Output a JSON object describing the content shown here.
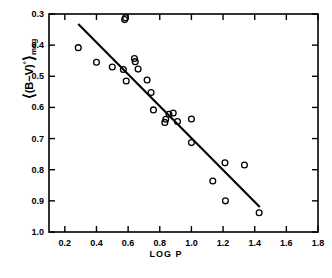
{
  "chart_data": {
    "type": "scatter",
    "title": "",
    "xlabel": "LOG P",
    "ylabel": "⟨(B−V)°⟩mag",
    "ylabel_parts": {
      "open_bracket": "⟨",
      "expression": "(B−V)",
      "superscript": "°",
      "close_bracket": "⟩",
      "subscript": "mag"
    },
    "xlim": [
      0.1,
      1.8
    ],
    "ylim": [
      0.3,
      1.0
    ],
    "y_inverted": true,
    "grid": false,
    "legend": null,
    "xticks": [
      0.2,
      0.4,
      0.6,
      0.8,
      1.0,
      1.2,
      1.4,
      1.6,
      1.8
    ],
    "xtick_labels": [
      "0.2",
      "0.4",
      "0.6",
      "0.8",
      "1.0",
      "1.2",
      "1.4",
      "1.6",
      "1.8"
    ],
    "yticks": [
      0.3,
      0.4,
      0.5,
      0.6,
      0.7,
      0.8,
      0.9,
      1.0
    ],
    "ytick_labels": [
      "0.3",
      "0.4",
      "0.5",
      "0.6",
      "0.7",
      "0.8",
      "0.9",
      "1.0"
    ],
    "marker": "open-circle",
    "points": [
      {
        "x": 0.285,
        "y": 0.408
      },
      {
        "x": 0.4,
        "y": 0.455
      },
      {
        "x": 0.5,
        "y": 0.47
      },
      {
        "x": 0.57,
        "y": 0.478
      },
      {
        "x": 0.578,
        "y": 0.318
      },
      {
        "x": 0.583,
        "y": 0.312
      },
      {
        "x": 0.588,
        "y": 0.515
      },
      {
        "x": 0.64,
        "y": 0.443
      },
      {
        "x": 0.645,
        "y": 0.453
      },
      {
        "x": 0.663,
        "y": 0.477
      },
      {
        "x": 0.72,
        "y": 0.512
      },
      {
        "x": 0.745,
        "y": 0.552
      },
      {
        "x": 0.76,
        "y": 0.608
      },
      {
        "x": 0.832,
        "y": 0.648
      },
      {
        "x": 0.838,
        "y": 0.638
      },
      {
        "x": 0.858,
        "y": 0.622
      },
      {
        "x": 0.885,
        "y": 0.618
      },
      {
        "x": 0.912,
        "y": 0.645
      },
      {
        "x": 1.0,
        "y": 0.637
      },
      {
        "x": 1.0,
        "y": 0.713
      },
      {
        "x": 1.135,
        "y": 0.836
      },
      {
        "x": 1.212,
        "y": 0.778
      },
      {
        "x": 1.215,
        "y": 0.9
      },
      {
        "x": 1.335,
        "y": 0.785
      },
      {
        "x": 1.428,
        "y": 0.938
      }
    ],
    "fit_line": {
      "x_start": 0.285,
      "y_start": 0.332,
      "x_end": 1.432,
      "y_end": 0.92,
      "slope": 0.5126,
      "intercept": 0.1859
    }
  },
  "style": {
    "axis_color": "#000000",
    "marker_color": "#000000",
    "line_color": "#000000",
    "background": "#ffffff"
  }
}
